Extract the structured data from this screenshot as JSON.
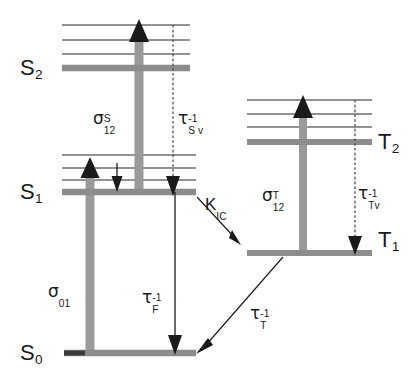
{
  "figure": {
    "type": "jablonski-energy-level-diagram",
    "width": 414,
    "height": 377,
    "background": "#ffffff"
  },
  "colors": {
    "level_thick": "#8c8c8c",
    "vibrational_line": "#6e6e6e",
    "arrow_thick": "#9a9a9a",
    "arrow_thin": "#1a1a1a",
    "text": "#1a1a1a",
    "dashed": "#4d4d4d"
  },
  "levels": [
    {
      "id": "S2",
      "label_base": "S",
      "label_sub": "2",
      "label_x": 20,
      "label_y": 57,
      "line_y": 68,
      "line_x1": 62,
      "line_x2": 190,
      "manifold": "singlet"
    },
    {
      "id": "S1",
      "label_base": "S",
      "label_sub": "1",
      "label_x": 20,
      "label_y": 181,
      "line_y": 192,
      "line_x1": 62,
      "line_x2": 196,
      "manifold": "singlet"
    },
    {
      "id": "S0",
      "label_base": "S",
      "label_sub": "0",
      "label_x": 20,
      "label_y": 342,
      "line_y": 353,
      "line_x1": 64,
      "line_x2": 196,
      "manifold": "singlet"
    },
    {
      "id": "T2",
      "label_base": "T",
      "label_sub": "2",
      "label_x": 378,
      "label_y": 131,
      "line_y": 142,
      "line_x1": 247,
      "line_x2": 372,
      "manifold": "triplet"
    },
    {
      "id": "T1",
      "label_base": "T",
      "label_sub": "1",
      "label_x": 378,
      "label_y": 229,
      "line_y": 253,
      "line_x1": 247,
      "line_x2": 372,
      "manifold": "triplet"
    }
  ],
  "vibrational_lines": [
    {
      "parent": "S2",
      "y": 25,
      "x1": 62,
      "x2": 190
    },
    {
      "parent": "S2",
      "y": 40,
      "x1": 62,
      "x2": 190
    },
    {
      "parent": "S2",
      "y": 54,
      "x1": 62,
      "x2": 190
    },
    {
      "parent": "S1",
      "y": 155,
      "x1": 62,
      "x2": 196
    },
    {
      "parent": "S1",
      "y": 168,
      "x1": 62,
      "x2": 196
    },
    {
      "parent": "S1",
      "y": 180,
      "x1": 62,
      "x2": 196
    },
    {
      "parent": "T2",
      "y": 100,
      "x1": 247,
      "x2": 372
    },
    {
      "parent": "T2",
      "y": 114,
      "x1": 247,
      "x2": 372
    },
    {
      "parent": "T2",
      "y": 127,
      "x1": 247,
      "x2": 372
    }
  ],
  "transitions": [
    {
      "id": "sigma01",
      "kind": "absorption",
      "style": "thick-gray-up-arrow",
      "x": 90,
      "y_from": 353,
      "y_to": 160,
      "label": {
        "base": "σ",
        "sub": "01",
        "sup": "",
        "x": 48,
        "y": 283
      }
    },
    {
      "id": "sigma12S",
      "kind": "excited-state-absorption",
      "style": "thick-gray-up-arrow",
      "x": 139,
      "y_from": 192,
      "y_to": 22,
      "label": {
        "base": "σ",
        "sub": "12",
        "sup": "S",
        "x": 93,
        "y": 110
      }
    },
    {
      "id": "tauSv",
      "kind": "vibrational-relaxation",
      "style": "dashed-down-arrow",
      "x": 173,
      "y_from": 25,
      "y_to": 192,
      "label": {
        "base": "τ",
        "sub": "S v",
        "sup": "-1",
        "x": 178,
        "y": 110
      }
    },
    {
      "id": "tauF",
      "kind": "fluorescence",
      "style": "thin-down-arrow",
      "x": 175,
      "y_from": 192,
      "y_to": 353,
      "label": {
        "base": "τ",
        "sub": "F",
        "sup": "-1",
        "x": 142,
        "y": 289
      }
    },
    {
      "id": "vibrelax-S1",
      "kind": "vibrational-relaxation-small",
      "style": "thin-down-arrow",
      "x": 117,
      "y_from": 163,
      "y_to": 190,
      "label": null
    },
    {
      "id": "kIC",
      "kind": "intersystem-crossing",
      "style": "thin-diagonal-arrow",
      "x_from": 196,
      "y_from": 196,
      "x_to": 240,
      "y_to": 243,
      "label": {
        "base": "K",
        "sub": "IC",
        "sup": "",
        "x": 205,
        "y": 196
      }
    },
    {
      "id": "sigma12T",
      "kind": "triplet-excited-absorption",
      "style": "thick-gray-up-arrow",
      "x": 303,
      "y_from": 253,
      "y_to": 98,
      "label": {
        "base": "σ",
        "sub": "12",
        "sup": "T",
        "x": 262,
        "y": 187
      }
    },
    {
      "id": "tauTv",
      "kind": "triplet-vibrational-relaxation",
      "style": "dashed-down-arrow",
      "x": 355,
      "y_from": 100,
      "y_to": 253,
      "label": {
        "base": "τ",
        "sub": "Tv",
        "sup": "-1",
        "x": 358,
        "y": 185
      }
    },
    {
      "id": "tauT",
      "kind": "phosphorescence",
      "style": "thin-diagonal-arrow",
      "x_from": 283,
      "y_from": 256,
      "x_to": 196,
      "y_to": 352,
      "label": {
        "base": "τ",
        "sub": "T",
        "sup": "-1",
        "x": 250,
        "y": 305
      }
    }
  ]
}
